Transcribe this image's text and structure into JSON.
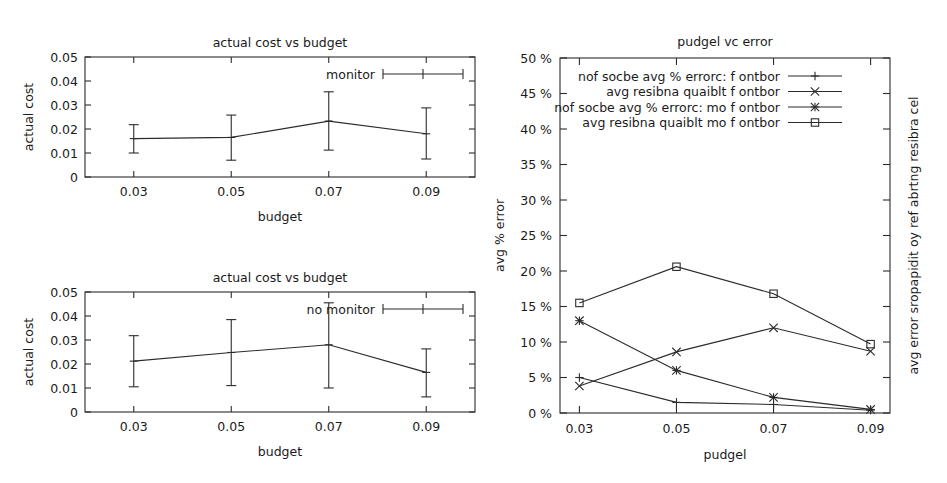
{
  "figure": {
    "background": "#ffffff",
    "ink": "#2b2b2b"
  },
  "panels": {
    "top_left": {
      "name": "actual-cost-monitor",
      "title": "actual cost vs budget",
      "xlabel": "budget",
      "ylabel": "actual cost",
      "legend": "monitor",
      "yticks": [
        "0",
        "0.01",
        "0.02",
        "0.03",
        "0.04",
        "0.05"
      ],
      "xticks": [
        "0.03",
        "0.05",
        "0.07",
        "0.09"
      ]
    },
    "bottom_left": {
      "name": "actual-cost-no-monitor",
      "title": "actual cost vs budget",
      "xlabel": "budget",
      "ylabel": "actual cost",
      "legend": "no monitor",
      "yticks": [
        "0",
        "0.01",
        "0.02",
        "0.03",
        "0.04",
        "0.05"
      ],
      "xticks": [
        "0.03",
        "0.05",
        "0.07",
        "0.09"
      ]
    },
    "right": {
      "name": "pudgel-vc-error",
      "title": "pudgel vc error",
      "xlabel": "pudgel",
      "ylabel": "avg % error",
      "ylabel_right": "avg error sropapidit oy ref abrtng resibra cel",
      "yticks": [
        "0 %",
        "5 %",
        "10 %",
        "15 %",
        "20 %",
        "25 %",
        "30 %",
        "35 %",
        "40 %",
        "45 %",
        "50 %"
      ],
      "xticks": [
        "0.03",
        "0.05",
        "0.07",
        "0.09"
      ],
      "legend_entries": [
        {
          "label": "nof socbe avg % errorc: f ontbor",
          "marker": "plus"
        },
        {
          "label": "avg resibna quaiblt f ontbor",
          "marker": "cross"
        },
        {
          "label": "nof socbe avg % errorc: mo f ontbor",
          "marker": "star"
        },
        {
          "label": "avg resibna quaiblt mo f ontbor",
          "marker": "square"
        }
      ]
    }
  },
  "chart_data": [
    {
      "type": "line",
      "id": "actual-cost-monitor",
      "title": "actual cost vs budget",
      "xlabel": "budget",
      "ylabel": "actual cost",
      "legend": [
        "monitor"
      ],
      "legend_position": "top-right",
      "grid": false,
      "x": [
        0.03,
        0.05,
        0.07,
        0.09
      ],
      "xticklabels": [
        "0.03",
        "0.05",
        "0.07",
        "0.09"
      ],
      "yticks": [
        0,
        0.01,
        0.02,
        0.03,
        0.04,
        0.05
      ],
      "yticklabels": [
        "0",
        "0.01",
        "0.02",
        "0.03",
        "0.04",
        "0.05"
      ],
      "ylim": [
        0,
        0.05
      ],
      "series": [
        {
          "name": "monitor",
          "values": [
            0.016,
            0.0165,
            0.0233,
            0.018
          ],
          "err_low": [
            0.01,
            0.007,
            0.0112,
            0.0075
          ],
          "err_high": [
            0.0218,
            0.0258,
            0.0355,
            0.0288
          ]
        }
      ]
    },
    {
      "type": "line",
      "id": "actual-cost-no-monitor",
      "title": "actual cost vs budget",
      "xlabel": "budget",
      "ylabel": "actual cost",
      "legend": [
        "no monitor"
      ],
      "legend_position": "top-right",
      "grid": false,
      "x": [
        0.03,
        0.05,
        0.07,
        0.09
      ],
      "xticklabels": [
        "0.03",
        "0.05",
        "0.07",
        "0.09"
      ],
      "yticks": [
        0,
        0.01,
        0.02,
        0.03,
        0.04,
        0.05
      ],
      "yticklabels": [
        "0",
        "0.01",
        "0.02",
        "0.03",
        "0.04",
        "0.05"
      ],
      "ylim": [
        0,
        0.05
      ],
      "series": [
        {
          "name": "no monitor",
          "values": [
            0.0212,
            0.0248,
            0.028,
            0.0165
          ],
          "err_low": [
            0.0105,
            0.011,
            0.01,
            0.0063
          ],
          "err_high": [
            0.0318,
            0.0385,
            0.0455,
            0.0263
          ]
        }
      ]
    },
    {
      "type": "line",
      "id": "pudgel-vc-error",
      "title": "pudgel vc error",
      "xlabel": "pudgel",
      "ylabel": "avg % error",
      "ylabel_right": "avg error sropapidit oy ref abrtng resibra cel",
      "legend_position": "top-center",
      "grid": false,
      "x": [
        0.03,
        0.05,
        0.07,
        0.09
      ],
      "xticklabels": [
        "0.03",
        "0.05",
        "0.07",
        "0.09"
      ],
      "yticks": [
        0,
        5,
        10,
        15,
        20,
        25,
        30,
        35,
        40,
        45,
        50
      ],
      "yticklabels": [
        "0 %",
        "5 %",
        "10 %",
        "15 %",
        "20 %",
        "25 %",
        "30 %",
        "35 %",
        "40 %",
        "45 %",
        "50 %"
      ],
      "ylim": [
        0,
        50
      ],
      "series": [
        {
          "name": "nof socbe avg % errorc: f ontbor",
          "marker": "plus",
          "values": [
            5.0,
            1.5,
            1.2,
            0.4
          ]
        },
        {
          "name": "avg resibna quaiblt f ontbor",
          "marker": "cross",
          "values": [
            3.8,
            8.6,
            12.0,
            8.7
          ]
        },
        {
          "name": "nof socbe avg % errorc: mo f ontbor",
          "marker": "star",
          "values": [
            13.0,
            6.0,
            2.2,
            0.5
          ]
        },
        {
          "name": "avg resibna quaiblt mo f ontbor",
          "marker": "square",
          "values": [
            15.5,
            20.6,
            16.8,
            9.7
          ]
        }
      ]
    }
  ]
}
